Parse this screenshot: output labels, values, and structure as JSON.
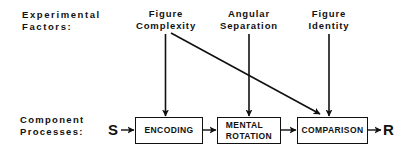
{
  "row_labels": {
    "factors_line1": "Experimental",
    "factors_line2": "Factors:",
    "processes_line1": "Component",
    "processes_line2": "Processes:"
  },
  "factors": [
    {
      "line1": "Figure",
      "line2": "Complexity"
    },
    {
      "line1": "Angular",
      "line2": "Separation"
    },
    {
      "line1": "Figure",
      "line2": "Identity"
    }
  ],
  "processes": [
    {
      "line1": "ENCODING",
      "line2": ""
    },
    {
      "line1": "MENTAL",
      "line2": "ROTATION"
    },
    {
      "line1": "COMPARISON",
      "line2": ""
    }
  ],
  "input_label": "S",
  "output_label": "R",
  "connections": [
    {
      "from": "Figure Complexity",
      "to": "ENCODING"
    },
    {
      "from": "Figure Complexity",
      "to": "COMPARISON"
    },
    {
      "from": "Angular Separation",
      "to": "MENTAL ROTATION"
    },
    {
      "from": "Figure Identity",
      "to": "COMPARISON"
    },
    {
      "from": "S",
      "to": "ENCODING"
    },
    {
      "from": "ENCODING",
      "to": "MENTAL ROTATION"
    },
    {
      "from": "MENTAL ROTATION",
      "to": "COMPARISON"
    },
    {
      "from": "COMPARISON",
      "to": "R"
    }
  ]
}
